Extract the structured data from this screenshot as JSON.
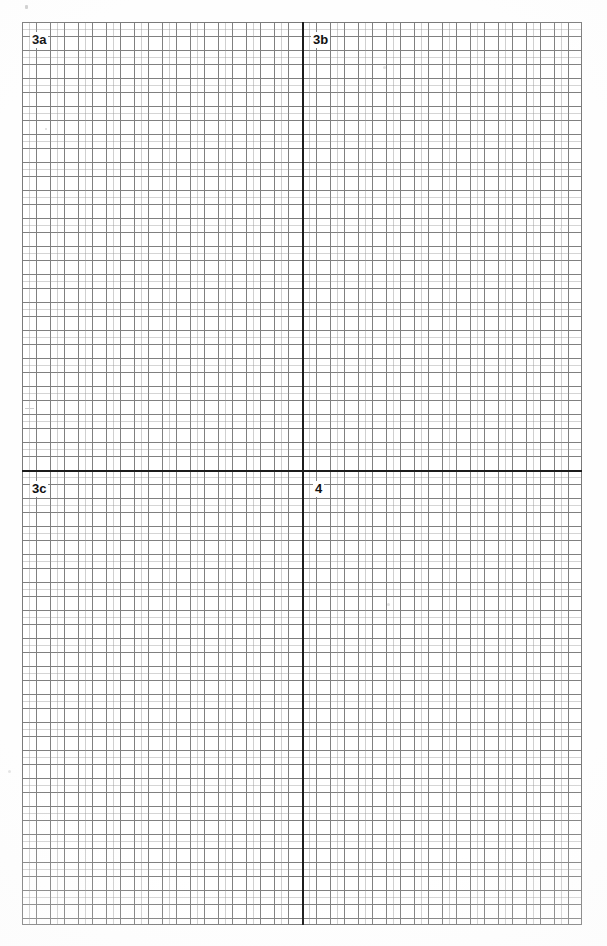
{
  "document": {
    "kind": "graph-paper-worksheet",
    "description": "Scanned sheet of quadrille graph paper with one heavy vertical axis and one heavy horizontal axis dividing the sheet into four labelled regions",
    "page_background_color": "#fefefe"
  },
  "grid": {
    "cell_size_px": 14,
    "columns": 40,
    "rows": 64,
    "left_px": 22,
    "top_px": 22,
    "width_px": 560,
    "height_px": 903,
    "line_color": "#6f6f6f",
    "border_color": "#7a7a7a",
    "fill_color": "#ffffff"
  },
  "axes": {
    "vertical": {
      "label": "vertical-axis",
      "x_px": 302,
      "color": "#1c1c1c",
      "thickness_px": 2
    },
    "horizontal": {
      "label": "horizontal-axis",
      "y_px": 470,
      "color": "#1c1c1c",
      "thickness_px": 2
    }
  },
  "quadrant_labels": [
    {
      "id": "3a",
      "text": "3a",
      "quadrant": "top-left"
    },
    {
      "id": "3b",
      "text": "3b",
      "quadrant": "top-right"
    },
    {
      "id": "3c",
      "text": "3c",
      "quadrant": "bottom-left"
    },
    {
      "id": "4",
      "text": "4",
      "quadrant": "bottom-right"
    }
  ],
  "chart_data": {
    "type": "scatter",
    "title": "",
    "subtitle": "",
    "xlabel": "",
    "ylabel": "",
    "grid": true,
    "legend": "none",
    "annotations": [
      "3a",
      "3b",
      "3c",
      "4"
    ],
    "series": [
      {
        "name": "empty-plot-area",
        "x": [],
        "y": []
      }
    ],
    "xlim": [
      -20,
      20
    ],
    "ylim": [
      -32,
      32
    ],
    "xticks": [],
    "yticks": []
  }
}
